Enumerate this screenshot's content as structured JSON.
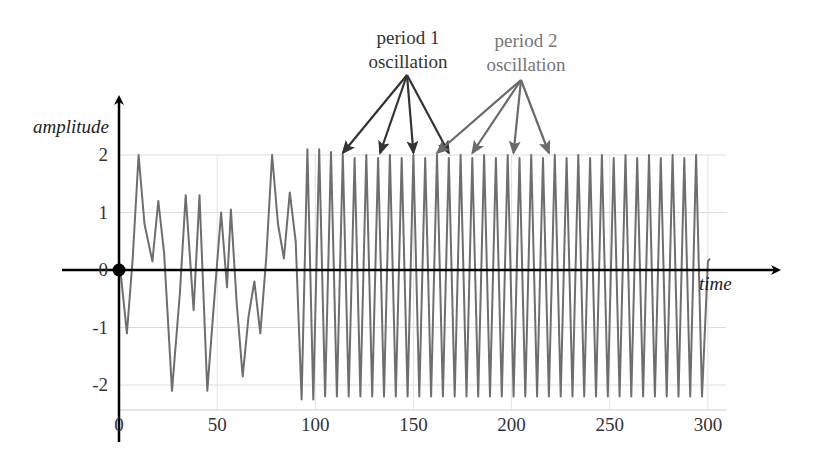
{
  "chart_data": {
    "type": "line",
    "title": "",
    "xlabel": "time",
    "ylabel": "amplitude",
    "xlim": [
      0,
      310
    ],
    "ylim": [
      -2.5,
      2.6
    ],
    "grid": true,
    "legend": null,
    "x_ticks": [
      0,
      50,
      100,
      150,
      200,
      250,
      300
    ],
    "x_tick_labels": [
      "0",
      "50",
      "100",
      "150",
      "200",
      "250",
      "300"
    ],
    "y_ticks": [
      2,
      1,
      0,
      -1,
      -2
    ],
    "y_tick_labels": [
      "2",
      "1",
      "0",
      "-1",
      "-2"
    ],
    "origin_marker": {
      "x": 0,
      "y": 0,
      "style": "filled black dot"
    },
    "annotations": [
      {
        "text_lines": [
          "period 1",
          "oscillation"
        ],
        "color": "#333333",
        "arrow_target_x": [
          114,
          133,
          150,
          168
        ],
        "arrow_target_y": 2.0
      },
      {
        "text_lines": [
          "period 2",
          "oscillation"
        ],
        "color": "#777777",
        "arrow_target_x": [
          162,
          180,
          201,
          219
        ],
        "arrow_target_y": 2.0
      }
    ],
    "series": [
      {
        "name": "amplitude",
        "color": "#6e6e6e",
        "x": [
          0,
          1,
          4,
          7,
          10,
          13,
          17,
          20,
          23,
          27,
          31,
          34,
          38,
          41,
          45,
          49,
          52,
          55,
          57,
          60,
          63,
          66,
          69,
          72,
          75,
          78,
          81,
          84,
          87,
          90,
          93,
          96,
          99,
          102,
          105,
          108,
          111,
          114,
          117,
          120,
          123,
          126,
          129,
          132,
          135,
          138,
          141,
          144,
          147,
          150,
          153,
          156,
          159,
          162,
          165,
          168,
          171,
          174,
          177,
          180,
          183,
          186,
          189,
          192,
          195,
          198,
          201,
          204,
          207,
          210,
          213,
          216,
          219,
          222,
          225,
          228,
          231,
          234,
          237,
          240,
          243,
          246,
          249,
          252,
          255,
          258,
          261,
          264,
          267,
          270,
          273,
          276,
          279,
          282,
          285,
          288,
          291,
          294,
          297,
          300,
          301
        ],
        "values": [
          0.15,
          -0.1,
          -1.1,
          0.2,
          2.0,
          0.8,
          0.15,
          1.2,
          0.3,
          -2.1,
          -0.4,
          1.3,
          -0.7,
          1.3,
          -2.1,
          -0.3,
          1.0,
          -0.3,
          1.05,
          -0.6,
          -1.85,
          -0.8,
          -0.2,
          -1.1,
          0.2,
          2.0,
          0.8,
          0.2,
          1.35,
          0.5,
          -2.25,
          2.1,
          -2.25,
          2.1,
          -2.2,
          2.05,
          -2.2,
          2.0,
          -2.2,
          1.95,
          -2.2,
          2.0,
          -2.2,
          1.95,
          -2.2,
          2.0,
          -2.2,
          1.95,
          -2.2,
          2.0,
          -2.2,
          1.95,
          -2.2,
          2.0,
          -2.2,
          1.95,
          -2.2,
          2.0,
          -2.2,
          1.95,
          -2.2,
          2.0,
          -2.2,
          1.95,
          -2.2,
          2.0,
          -2.2,
          1.95,
          -2.2,
          2.0,
          -2.2,
          1.95,
          -2.2,
          2.0,
          -2.2,
          1.95,
          -2.2,
          2.0,
          -2.2,
          1.95,
          -2.2,
          2.0,
          -2.2,
          1.95,
          -2.2,
          2.0,
          -2.2,
          1.95,
          -2.2,
          2.0,
          -2.2,
          1.95,
          -2.2,
          2.0,
          -2.2,
          1.95,
          -2.2,
          2.0,
          -2.2,
          0.15,
          0.2
        ]
      }
    ]
  }
}
